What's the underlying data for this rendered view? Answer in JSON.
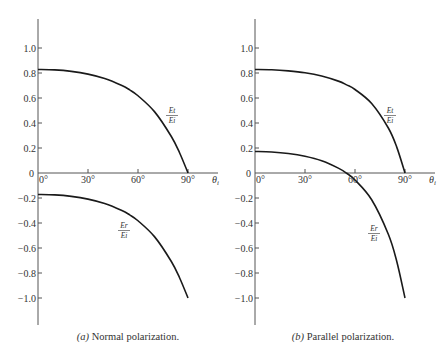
{
  "chart_data": [
    {
      "type": "line",
      "title": "",
      "caption_letter": "(a)",
      "caption": "Normal polarization.",
      "xlabel": "θi",
      "ylabel": "",
      "xlim": [
        0,
        90
      ],
      "ylim": [
        -1.2,
        1.2
      ],
      "x_ticks": [
        "0°",
        "30°",
        "60°",
        "90°"
      ],
      "y_ticks": [
        "1.0",
        "0.8",
        "0.6",
        "0.4",
        "0.2",
        "0",
        "-0.2",
        "-0.4",
        "-0.6",
        "-0.8",
        "-1.0"
      ],
      "grid": false,
      "x": [
        0,
        10,
        20,
        30,
        40,
        50,
        55,
        60,
        70,
        80,
        85,
        90
      ],
      "series": [
        {
          "name": "Et/Ei",
          "label_num": "Et",
          "label_den": "Ei",
          "values": [
            0.828,
            0.825,
            0.813,
            0.791,
            0.756,
            0.702,
            0.665,
            0.618,
            0.489,
            0.292,
            0.16,
            0.0
          ]
        },
        {
          "name": "Er/Ei",
          "label_num": "Er",
          "label_den": "Ei",
          "values": [
            -0.172,
            -0.175,
            -0.187,
            -0.209,
            -0.244,
            -0.298,
            -0.335,
            -0.382,
            -0.511,
            -0.708,
            -0.84,
            -1.0
          ]
        }
      ]
    },
    {
      "type": "line",
      "title": "",
      "caption_letter": "(b)",
      "caption": "Parallel polarization.",
      "xlabel": "θi",
      "ylabel": "",
      "xlim": [
        0,
        90
      ],
      "ylim": [
        -1.2,
        1.2
      ],
      "x_ticks": [
        "0°",
        "30°",
        "60°",
        "90°"
      ],
      "y_ticks": [
        "1.0",
        "0.8",
        "0.6",
        "0.4",
        "0.2",
        "0",
        "-0.2",
        "-0.4",
        "-0.6",
        "-0.8",
        "-1.0"
      ],
      "grid": false,
      "x": [
        0,
        10,
        20,
        30,
        40,
        50,
        55,
        60,
        70,
        80,
        85,
        90
      ],
      "series": [
        {
          "name": "Et/Ei",
          "label_num": "Et",
          "label_den": "Ei",
          "values": [
            0.828,
            0.826,
            0.817,
            0.802,
            0.776,
            0.735,
            0.705,
            0.668,
            0.556,
            0.36,
            0.209,
            0.0
          ]
        },
        {
          "name": "Er/Ei",
          "label_num": "Er",
          "label_den": "Ei",
          "values": [
            0.172,
            0.168,
            0.156,
            0.134,
            0.098,
            0.039,
            -0.002,
            -0.056,
            -0.214,
            -0.49,
            -0.704,
            -1.0
          ]
        }
      ]
    }
  ]
}
